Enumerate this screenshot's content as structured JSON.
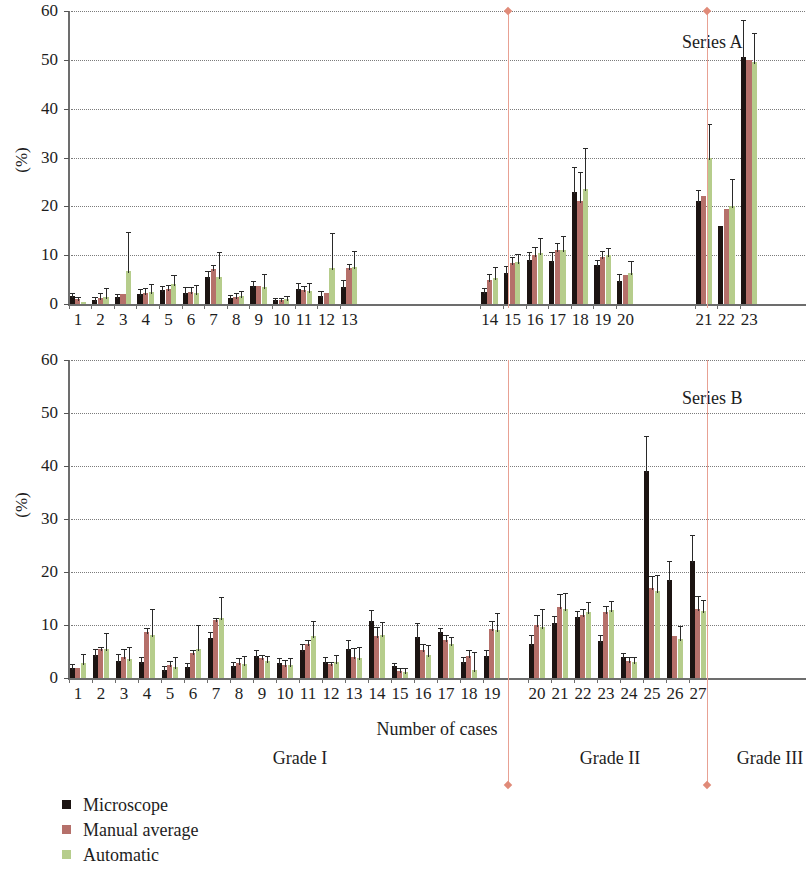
{
  "figure": {
    "ylabel": "(%)",
    "xaxis_title": "Number of cases",
    "yticks": [
      0,
      10,
      20,
      30,
      40,
      50,
      60
    ],
    "ylim": [
      0,
      60
    ]
  },
  "legend": {
    "items": [
      {
        "label": "Microscope",
        "color": "#1c1412"
      },
      {
        "label": "Manual average",
        "color": "#b5706a"
      },
      {
        "label": "Automatic",
        "color": "#b6cd8c"
      }
    ]
  },
  "grades": [
    {
      "label": "Grade I"
    },
    {
      "label": "Grade II"
    },
    {
      "label": "Grade III"
    }
  ],
  "chart_data": [
    {
      "type": "bar",
      "title": "Series A",
      "xlabel": "Number of cases",
      "ylabel": "(%)",
      "ylim": [
        0,
        60
      ],
      "yticks": [
        0,
        10,
        20,
        30,
        40,
        50,
        60
      ],
      "grid": "horizontal-dotted",
      "legend_position": "below-figure",
      "categories": [
        "1",
        "2",
        "3",
        "4",
        "5",
        "6",
        "7",
        "8",
        "9",
        "10",
        "11",
        "12",
        "13",
        "14",
        "15",
        "16",
        "17",
        "18",
        "19",
        "20",
        "21",
        "22",
        "23"
      ],
      "grade_groups": [
        {
          "label": "Grade I",
          "categories": [
            "1",
            "2",
            "3",
            "4",
            "5",
            "6",
            "7",
            "8",
            "9",
            "10",
            "11",
            "12",
            "13"
          ]
        },
        {
          "label": "Grade II",
          "categories": [
            "14",
            "15",
            "16",
            "17",
            "18",
            "19",
            "20"
          ]
        },
        {
          "label": "Grade III",
          "categories": [
            "21",
            "22",
            "23"
          ]
        }
      ],
      "series": [
        {
          "name": "Microscope",
          "color": "#1c1412",
          "values": [
            1.6,
            0.9,
            1.5,
            2.1,
            2.8,
            2.3,
            5.5,
            1.2,
            3.6,
            0.8,
            3.0,
            1.7,
            3.5,
            2.4,
            6.4,
            9.0,
            8.8,
            23.0,
            7.9,
            4.8,
            21.0,
            16.0,
            50.6
          ],
          "err": [
            0.6,
            0.6,
            0.6,
            0.9,
            0.8,
            1.2,
            1.3,
            0.7,
            1.1,
            0.5,
            1.2,
            0.9,
            1.4,
            0.9,
            1.3,
            1.6,
            1.8,
            5.0,
            1.2,
            1.4,
            2.4,
            0.0,
            7.5
          ]
        },
        {
          "name": "Manual average",
          "color": "#b5706a",
          "values": [
            1.0,
            1.3,
            2.1,
            2.3,
            3.0,
            2.4,
            7.1,
            1.5,
            3.6,
            0.8,
            2.8,
            2.2,
            7.3,
            5.0,
            8.4,
            10.0,
            11.0,
            21.0,
            9.6,
            6.0,
            22.2,
            19.5,
            50.0
          ],
          "err": [
            0.5,
            1.0,
            0.0,
            0.9,
            0.8,
            1.0,
            0.8,
            0.7,
            0.0,
            0.4,
            0.9,
            0.0,
            0.9,
            1.2,
            1.2,
            1.6,
            1.5,
            6.0,
            1.2,
            0.0,
            0.0,
            0.0,
            0.0
          ]
        },
        {
          "name": "Automatic",
          "color": "#b6cd8c",
          "values": [
            0.4,
            1.4,
            6.8,
            2.4,
            4.0,
            2.2,
            5.6,
            1.6,
            3.4,
            1.0,
            2.6,
            7.4,
            7.6,
            5.4,
            8.6,
            10.5,
            11.0,
            23.5,
            10.0,
            6.4,
            29.8,
            20.0,
            49.5
          ],
          "err": [
            0.0,
            1.8,
            8.0,
            1.6,
            1.9,
            1.6,
            5.0,
            1.0,
            2.8,
            0.6,
            1.6,
            7.2,
            3.2,
            2.1,
            1.7,
            3.0,
            3.0,
            8.5,
            1.5,
            2.5,
            7.0,
            5.6,
            6.0
          ]
        }
      ]
    },
    {
      "type": "bar",
      "title": "Series B",
      "xlabel": "Number of cases",
      "ylabel": "(%)",
      "ylim": [
        0,
        60
      ],
      "yticks": [
        0,
        10,
        20,
        30,
        40,
        50,
        60
      ],
      "grid": "horizontal-dotted",
      "legend_position": "below-figure",
      "categories": [
        "1",
        "2",
        "3",
        "4",
        "5",
        "6",
        "7",
        "8",
        "9",
        "10",
        "11",
        "12",
        "13",
        "14",
        "15",
        "16",
        "17",
        "18",
        "19",
        "20",
        "21",
        "22",
        "23",
        "24",
        "25",
        "26",
        "27"
      ],
      "grade_groups": [
        {
          "label": "Grade I",
          "categories": [
            "1",
            "2",
            "3",
            "4",
            "5",
            "6",
            "7",
            "8",
            "9",
            "10",
            "11",
            "12",
            "13",
            "14",
            "15",
            "16",
            "17",
            "18",
            "19"
          ]
        },
        {
          "label": "Grade II",
          "categories": [
            "20",
            "21",
            "22",
            "23",
            "24",
            "25",
            "26",
            "27"
          ]
        },
        {
          "label": "Grade III",
          "categories": []
        }
      ],
      "series": [
        {
          "name": "Microscope",
          "color": "#1c1412",
          "values": [
            1.9,
            4.3,
            3.2,
            3.0,
            1.6,
            2.0,
            7.5,
            2.3,
            4.1,
            2.9,
            5.2,
            3.0,
            5.5,
            10.7,
            2.2,
            7.8,
            8.6,
            3.0,
            4.2,
            6.4,
            10.4,
            11.6,
            7.0,
            4.0,
            39.0,
            18.4,
            22.0
          ],
          "err": [
            0.7,
            1.2,
            1.3,
            1.0,
            0.7,
            0.9,
            1.2,
            0.8,
            1.1,
            0.9,
            1.2,
            0.9,
            1.6,
            2.2,
            0.6,
            2.6,
            0.9,
            0.9,
            1.1,
            1.7,
            1.3,
            1.0,
            1.2,
            0.7,
            6.6,
            3.6,
            5.0
          ]
        },
        {
          "name": "Manual average",
          "color": "#b5706a",
          "values": [
            1.8,
            5.4,
            4.0,
            8.6,
            2.5,
            4.7,
            10.9,
            2.8,
            3.7,
            2.5,
            6.5,
            2.6,
            4.0,
            8.0,
            1.4,
            5.2,
            7.2,
            4.2,
            9.3,
            10.0,
            13.4,
            11.8,
            12.4,
            3.2,
            17.0,
            8.0,
            13.0
          ],
          "err": [
            0.0,
            0.5,
            1.4,
            0.8,
            0.8,
            0.6,
            0.4,
            0.9,
            0.6,
            0.9,
            0.6,
            0.5,
            1.6,
            1.6,
            0.4,
            1.2,
            0.9,
            1.0,
            1.5,
            1.9,
            2.4,
            1.2,
            1.2,
            0.7,
            2.2,
            0.0,
            2.4
          ]
        },
        {
          "name": "Automatic",
          "color": "#b6cd8c",
          "values": [
            2.9,
            5.4,
            3.6,
            8.2,
            2.0,
            5.4,
            11.3,
            2.6,
            3.2,
            2.5,
            8.0,
            3.1,
            3.8,
            8.1,
            1.1,
            4.4,
            6.4,
            1.6,
            9.1,
            9.6,
            13.0,
            12.4,
            12.8,
            3.0,
            16.4,
            7.4,
            12.6
          ],
          "err": [
            1.6,
            3.0,
            2.2,
            4.8,
            2.0,
            4.6,
            3.9,
            1.6,
            1.0,
            1.2,
            2.8,
            1.2,
            2.0,
            2.4,
            0.8,
            1.8,
            1.4,
            3.4,
            3.2,
            3.4,
            3.0,
            2.0,
            1.8,
            1.0,
            3.0,
            2.4,
            2.2
          ]
        }
      ]
    }
  ]
}
